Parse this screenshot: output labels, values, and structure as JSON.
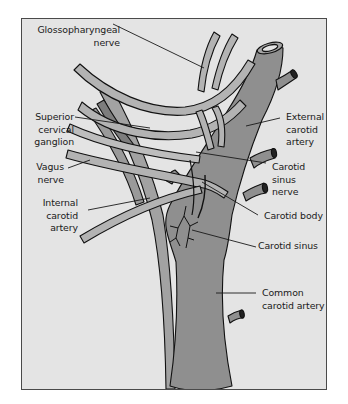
{
  "diagram": {
    "colors": {
      "background": "#e4e4e4",
      "frame_border": "#4a4a4a",
      "artery_fill": "#8f8f8f",
      "nerve_fill": "#b3b3b3",
      "outline": "#111111",
      "leader_line": "#1a1a1a"
    },
    "labels": {
      "glossopharyngeal": "Glossopharyngeal\nnerve",
      "superior_cervical": "Superior\ncervical\nganglion",
      "vagus": "Vagus\nnerve",
      "internal_carotid": "Internal\ncarotid\nartery",
      "external_carotid": "External\ncarotid\nartery",
      "carotid_sinus_nerve": "Carotid\nsinus\nnerve",
      "carotid_body": "Carotid body",
      "carotid_sinus": "Carotid sinus",
      "common_carotid": "Common\ncarotid artery"
    }
  }
}
